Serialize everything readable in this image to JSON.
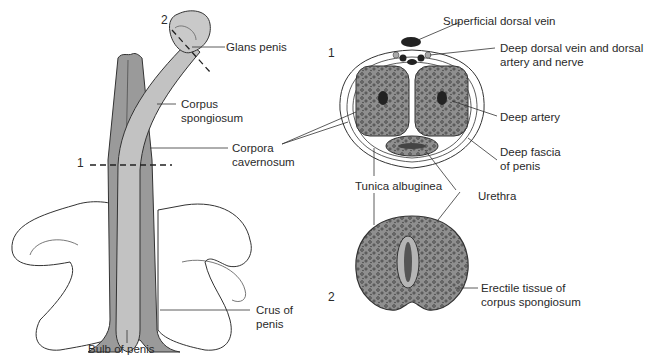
{
  "figure": {
    "left_view": {
      "section_marks": [
        "1",
        "2"
      ],
      "labels": {
        "glans": "Glans penis",
        "corpus_spongiosum_1": "Corpus",
        "corpus_spongiosum_2": "spongiosum",
        "corpora_cavernosum_1": "Corpora",
        "corpora_cavernosum_2": "cavernosum",
        "crus_1": "Crus of",
        "crus_2": "penis",
        "bulb": "Bulb of penis"
      }
    },
    "section_1": {
      "number": "1",
      "labels": {
        "superficial_vein": "Superficial dorsal vein",
        "deep_dorsal_1": "Deep dorsal vein and dorsal",
        "deep_dorsal_2": "artery and nerve",
        "deep_artery": "Deep artery",
        "deep_fascia_1": "Deep fascia",
        "deep_fascia_2": "of penis",
        "tunica": "Tunica albuginea",
        "urethra": "Urethra"
      }
    },
    "section_2": {
      "number": "2",
      "labels": {
        "erectile_1": "Erectile tissue of",
        "erectile_2": "corpus spongiosum"
      }
    },
    "colors": {
      "tissue_dark": "#8a8a8a",
      "tissue_mid": "#a9a9a9",
      "tissue_light": "#c4c4c4",
      "bone": "#ffffff",
      "line": "#333333"
    }
  }
}
